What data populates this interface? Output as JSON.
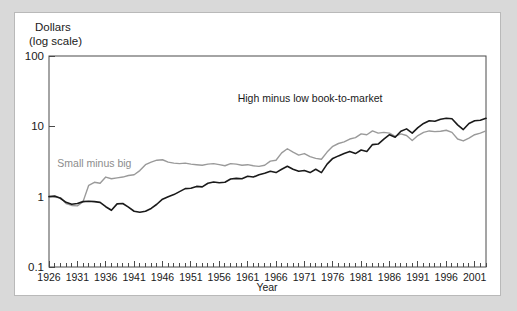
{
  "figure": {
    "background_color": "#d9d9d9",
    "card_color": "#ffffff",
    "border_color": "#b9b9b9"
  },
  "chart_data": {
    "type": "line",
    "title": "",
    "xlabel": "Year",
    "ylabel": "Dollars (log scale)",
    "ylabel_line1": "Dollars",
    "ylabel_line2": "(log scale)",
    "yscale": "log",
    "ylim": [
      0.1,
      100
    ],
    "ytick_labels": [
      "100",
      "10",
      "1",
      "0.1"
    ],
    "ytick_values": [
      100,
      10,
      1,
      0.1
    ],
    "xlim": [
      1926,
      2003
    ],
    "xtick_labels": [
      "1926",
      "1931",
      "1936",
      "1941",
      "1946",
      "1951",
      "1956",
      "1961",
      "1966",
      "1971",
      "1976",
      "1981",
      "1986",
      "1991",
      "1996",
      "2001"
    ],
    "xtick_values": [
      1926,
      1931,
      1936,
      1941,
      1946,
      1951,
      1956,
      1961,
      1966,
      1971,
      1976,
      1981,
      1986,
      1991,
      1996,
      2001
    ],
    "minor_xticks": "annual",
    "grid": false,
    "legend_position": "inline-annotation",
    "x": [
      1926,
      1927,
      1928,
      1929,
      1930,
      1931,
      1932,
      1933,
      1934,
      1935,
      1936,
      1937,
      1938,
      1939,
      1940,
      1941,
      1942,
      1943,
      1944,
      1945,
      1946,
      1947,
      1948,
      1949,
      1950,
      1951,
      1952,
      1953,
      1954,
      1955,
      1956,
      1957,
      1958,
      1959,
      1960,
      1961,
      1962,
      1963,
      1964,
      1965,
      1966,
      1967,
      1968,
      1969,
      1970,
      1971,
      1972,
      1973,
      1974,
      1975,
      1976,
      1977,
      1978,
      1979,
      1980,
      1981,
      1982,
      1983,
      1984,
      1985,
      1986,
      1987,
      1988,
      1989,
      1990,
      1991,
      1992,
      1993,
      1994,
      1995,
      1996,
      1997,
      1998,
      1999,
      2000,
      2001,
      2002,
      2003
    ],
    "series": [
      {
        "name": "High minus low book-to-market",
        "color": "#1a1a1a",
        "label_x": 1972,
        "label_y": 22,
        "values": [
          1.0,
          1.02,
          0.95,
          0.83,
          0.78,
          0.8,
          0.85,
          0.86,
          0.85,
          0.83,
          0.72,
          0.64,
          0.79,
          0.8,
          0.71,
          0.62,
          0.6,
          0.62,
          0.68,
          0.78,
          0.92,
          1.0,
          1.07,
          1.18,
          1.3,
          1.32,
          1.4,
          1.38,
          1.55,
          1.62,
          1.58,
          1.6,
          1.78,
          1.82,
          1.8,
          1.95,
          1.9,
          2.05,
          2.15,
          2.3,
          2.2,
          2.45,
          2.7,
          2.45,
          2.3,
          2.35,
          2.2,
          2.45,
          2.2,
          2.9,
          3.5,
          3.8,
          4.1,
          4.4,
          4.1,
          4.6,
          4.4,
          5.5,
          5.6,
          6.6,
          7.6,
          7.0,
          8.5,
          9.2,
          8.0,
          9.6,
          11.0,
          12.0,
          11.8,
          12.6,
          13.0,
          12.8,
          10.5,
          9.0,
          11.0,
          12.0,
          12.2,
          13.0
        ]
      },
      {
        "name": "Small minus big",
        "color": "#9a9a9a",
        "label_x": 1934,
        "label_y": 2.6,
        "values": [
          1.0,
          0.98,
          0.97,
          0.8,
          0.75,
          0.74,
          0.85,
          1.45,
          1.6,
          1.55,
          1.9,
          1.8,
          1.85,
          1.9,
          2.0,
          2.05,
          2.35,
          2.85,
          3.1,
          3.3,
          3.35,
          3.1,
          3.0,
          2.95,
          3.0,
          2.9,
          2.85,
          2.8,
          2.9,
          2.95,
          2.85,
          2.75,
          2.95,
          2.9,
          2.8,
          2.85,
          2.75,
          2.7,
          2.8,
          3.2,
          3.3,
          4.2,
          4.8,
          4.3,
          3.9,
          4.1,
          3.7,
          3.5,
          3.4,
          4.3,
          5.2,
          5.7,
          6.0,
          6.6,
          6.9,
          7.8,
          7.6,
          8.6,
          8.0,
          8.2,
          8.0,
          7.2,
          7.8,
          7.4,
          6.3,
          7.4,
          8.2,
          8.6,
          8.4,
          8.5,
          8.8,
          8.2,
          6.6,
          6.2,
          6.8,
          7.6,
          8.0,
          8.6
        ]
      }
    ]
  }
}
